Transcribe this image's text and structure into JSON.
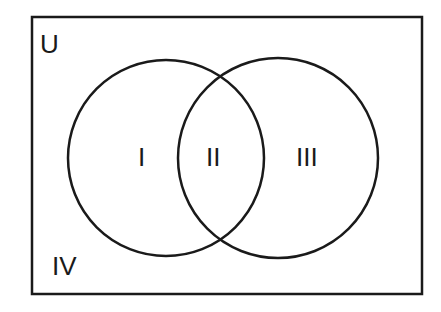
{
  "diagram": {
    "type": "venn",
    "universe_label": "U",
    "regions": [
      {
        "id": "I",
        "label": "I"
      },
      {
        "id": "II",
        "label": "II"
      },
      {
        "id": "III",
        "label": "III"
      },
      {
        "id": "IV",
        "label": "IV"
      }
    ],
    "stroke_color": "#1a1a1a",
    "background": "#ffffff"
  }
}
